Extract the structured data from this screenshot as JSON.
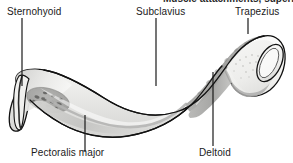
{
  "figure": {
    "title_cropped": "Muscle attachments, superior surface",
    "background_color": "#ffffff",
    "outline_color": "#000000",
    "bone_fill_color": "#f2f2f0",
    "shading_light": "#e3e3e1",
    "shading_mid": "#bdbdbb",
    "shading_dark": "#8f8f8d",
    "leader_color": "#1a1a1a"
  },
  "labels": {
    "sternohyoid": "Sternohyoid",
    "subclavius": "Subclavius",
    "trapezius": "Trapezius",
    "pectoralis_major": "Pectoralis major",
    "deltoid": "Deltoid"
  },
  "leader_lines": [
    {
      "name": "sternohyoid-leader",
      "x1": 22,
      "y1": 18,
      "x2": 22,
      "y2": 86
    },
    {
      "name": "subclavius-leader",
      "x1": 156,
      "y1": 18,
      "x2": 156,
      "y2": 86
    },
    {
      "name": "trapezius-leader",
      "x1": 248,
      "y1": 18,
      "x2": 248,
      "y2": 34
    },
    {
      "name": "pectoralis-leader",
      "x1": 85,
      "y1": 115,
      "x2": 85,
      "y2": 152
    },
    {
      "name": "deltoid-leader",
      "x1": 213,
      "y1": 72,
      "x2": 213,
      "y2": 146
    }
  ],
  "attachment_regions": [
    {
      "name": "sternohyoid-region",
      "muscle": "Sternohyoid",
      "location": "medial-inferior-sternal-end"
    },
    {
      "name": "pectoralis-major-region",
      "muscle": "Pectoralis major",
      "location": "medial-anterior-shaft"
    },
    {
      "name": "subclavius-region",
      "muscle": "Subclavius",
      "location": "inferior-mid-shaft-groove"
    },
    {
      "name": "trapezius-region",
      "muscle": "Trapezius",
      "location": "posterior-lateral-third"
    },
    {
      "name": "deltoid-region",
      "muscle": "Deltoid",
      "location": "anterior-lateral-third"
    }
  ]
}
